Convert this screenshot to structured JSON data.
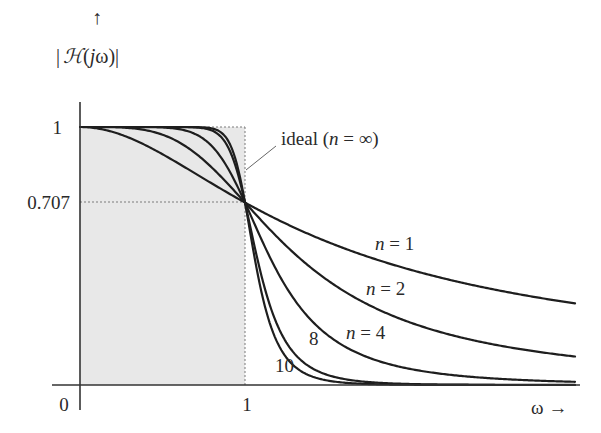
{
  "chart_data": {
    "type": "line",
    "title": "",
    "ylabel": "|H(jω)|",
    "ylabel_parts": {
      "bar_left": "|",
      "H": "ℋ",
      "open": "(",
      "j": "j",
      "omega": "ω",
      "close": ")",
      "bar_right": "|"
    },
    "ylabel_arrow": "↑",
    "xlabel": "ω →",
    "xlabel_symbol": "ω",
    "xlabel_arrow": "→",
    "xlim": [
      0,
      3
    ],
    "ylim": [
      0,
      1
    ],
    "x_ticks": [
      {
        "value": 0,
        "label": "0"
      },
      {
        "value": 1,
        "label": "1"
      }
    ],
    "y_ticks": [
      {
        "value": 1,
        "label": "1"
      },
      {
        "value": 0.707,
        "label": "0.707"
      }
    ],
    "grid": false,
    "reference_lines": [
      {
        "orientation": "horizontal",
        "value": 0.707,
        "style": "dotted",
        "from": 0,
        "to": 1
      },
      {
        "orientation": "horizontal",
        "value": 1,
        "style": "dotted",
        "from": 0,
        "to": 1
      },
      {
        "orientation": "vertical",
        "value": 1,
        "style": "dotted",
        "from": 0,
        "to": 1
      }
    ],
    "shaded_region": {
      "x": [
        0,
        1
      ],
      "y": [
        0,
        1
      ],
      "label": "ideal (n = ∞)",
      "color": "#e6e6e6"
    },
    "formula": "|H(jω)| = 1 / sqrt(1 + ω^(2n))",
    "series": [
      {
        "name": "n = 1",
        "n": 1,
        "label": "n = 1",
        "x": [
          0,
          0.5,
          1,
          1.5,
          2,
          2.5,
          3
        ],
        "values": [
          1.0,
          0.894,
          0.707,
          0.555,
          0.447,
          0.371,
          0.316
        ]
      },
      {
        "name": "n = 2",
        "n": 2,
        "label": "n = 2",
        "x": [
          0,
          0.5,
          1,
          1.5,
          2,
          2.5,
          3
        ],
        "values": [
          1.0,
          0.97,
          0.707,
          0.406,
          0.243,
          0.158,
          0.11
        ]
      },
      {
        "name": "n = 4",
        "n": 4,
        "label": "n = 4",
        "x": [
          0,
          0.5,
          1,
          1.5,
          2,
          2.5,
          3
        ],
        "values": [
          1.0,
          0.998,
          0.707,
          0.194,
          0.062,
          0.026,
          0.012
        ]
      },
      {
        "name": "n = 8",
        "n": 8,
        "label": "8",
        "x": [
          0,
          0.5,
          1,
          1.5,
          2,
          2.5,
          3
        ],
        "values": [
          1.0,
          1.0,
          0.707,
          0.039,
          0.004,
          0.001,
          0.0
        ]
      },
      {
        "name": "n = 10",
        "n": 10,
        "label": "10",
        "x": [
          0,
          0.5,
          1,
          1.5,
          2,
          2.5,
          3
        ],
        "values": [
          1.0,
          1.0,
          0.707,
          0.017,
          0.001,
          0.0,
          0.0
        ]
      }
    ],
    "annotations": [
      {
        "text": "ideal (n = ∞)",
        "points_to": [
          1,
          0.85
        ]
      },
      {
        "text": "n = 1",
        "at": [
          2.0,
          0.5
        ]
      },
      {
        "text": "n = 2",
        "at": [
          1.95,
          0.32
        ]
      },
      {
        "text": "n = 4",
        "at": [
          1.65,
          0.18
        ]
      },
      {
        "text": "8",
        "at": [
          1.28,
          0.16
        ]
      },
      {
        "text": "10",
        "at": [
          1.15,
          0.07
        ]
      }
    ]
  },
  "labels": {
    "y_tick_1": "1",
    "y_tick_0707": "0.707",
    "x_tick_0": "0",
    "x_tick_1": "1",
    "ideal_text": "ideal (",
    "ideal_n": "n",
    "ideal_eq": " = ∞)",
    "n1_n": "n",
    "n1_eq": " = 1",
    "n2_n": "n",
    "n2_eq": " = 2",
    "n4_n": "n",
    "n4_eq": " = 4",
    "n8": "8",
    "n10": "10"
  },
  "colors": {
    "curve": "#1e1e1e",
    "shade": "#e8e8e8",
    "axis": "#333333",
    "dotted": "#777777"
  }
}
